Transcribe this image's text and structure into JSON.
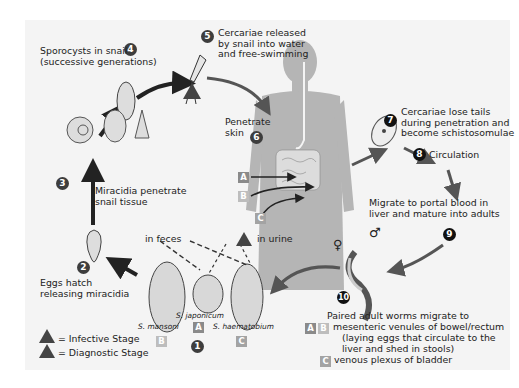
{
  "diagram": {
    "colors": {
      "background": "#f4f4f4",
      "arrow": "#5a5a5a",
      "arrow_dark": "#222222",
      "body": "#b4b4b4",
      "badge": "#3d3d3d"
    },
    "steps": [
      {
        "num": "1",
        "label": ""
      },
      {
        "num": "2",
        "label": "Eggs hatch\nreleasing miracidia"
      },
      {
        "num": "3",
        "label": "Miracidia penetrate\nsnail tissue"
      },
      {
        "num": "4",
        "label": "Sporocysts in snail\n(successive generations)"
      },
      {
        "num": "5",
        "label": "Cercariae released\nby snail into water\nand free-swimming"
      },
      {
        "num": "6",
        "label": "Penetrate\nskin"
      },
      {
        "num": "7",
        "label": "Cercariae lose tails\nduring penetration and\nbecome schistosomulae"
      },
      {
        "num": "8",
        "label": "Circulation"
      },
      {
        "num": "9",
        "label": "Migrate to portal blood in\nliver and mature into adults"
      },
      {
        "num": "10",
        "label": "Paired adult worms migrate to"
      }
    ],
    "step10_details": {
      "ab_text": "mesenteric venules of bowel/rectum",
      "ab_sub": "(laying eggs that circulate to the\nliver and shed in stools)",
      "c_text": "venous plexus of bladder"
    },
    "eggs": {
      "in_feces": "in feces",
      "in_urine": "in urine",
      "species": [
        {
          "name": "S. mansoni",
          "code": "B"
        },
        {
          "name": "S. japonicum",
          "code": "A"
        },
        {
          "name": "S. haematobium",
          "code": "C"
        }
      ]
    },
    "body_codes": [
      "A",
      "B",
      "C"
    ],
    "stage_markers": {
      "infective": "i",
      "diagnostic": "d"
    },
    "legend": [
      {
        "symbol": "i",
        "label": "= Infective Stage"
      },
      {
        "symbol": "d",
        "label": "= Diagnostic Stage"
      }
    ],
    "sex_symbols": {
      "female": "♀",
      "male": "♂"
    }
  }
}
